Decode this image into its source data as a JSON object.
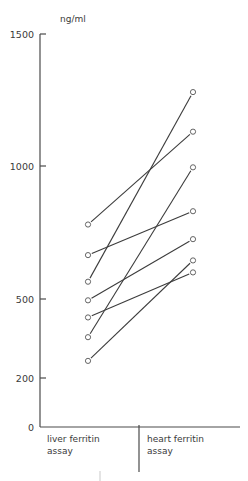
{
  "chart_data": {
    "type": "line",
    "title": "",
    "unit_label": "ng/ml",
    "ylabel": "ng/ml",
    "xlabel": "",
    "categories": [
      "liver ferritin assay",
      "heart ferritin assay"
    ],
    "category_lines": [
      [
        "liver ferritin",
        "assay"
      ],
      [
        "heart ferritin",
        "assay"
      ]
    ],
    "yticks": [
      0,
      200,
      500,
      1000,
      1500
    ],
    "ylim": [
      0,
      1500
    ],
    "grid": false,
    "legend": "none",
    "series": [
      {
        "name": "sample 1",
        "values": [
          780,
          1130
        ]
      },
      {
        "name": "sample 2",
        "values": [
          665,
          830
        ]
      },
      {
        "name": "sample 3",
        "values": [
          565,
          1280
        ]
      },
      {
        "name": "sample 4",
        "values": [
          495,
          725
        ]
      },
      {
        "name": "sample 5",
        "values": [
          430,
          600
        ]
      },
      {
        "name": "sample 6",
        "values": [
          355,
          995
        ]
      },
      {
        "name": "sample 7",
        "values": [
          265,
          645
        ]
      }
    ]
  },
  "layout": {
    "axis_x": 40,
    "baseline_y": 427,
    "x_end": 240,
    "left_x": 88,
    "right_x": 193,
    "separator_x": 139,
    "tick_pixels": {
      "0": 427,
      "200": 378,
      "500": 299,
      "1000": 166,
      "1500": 34
    }
  }
}
